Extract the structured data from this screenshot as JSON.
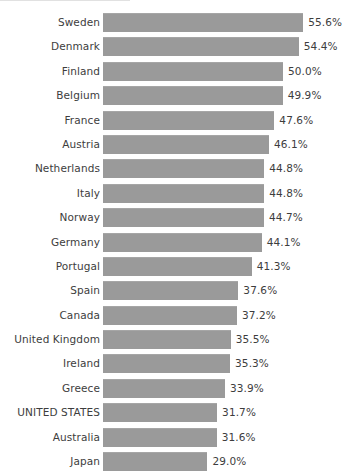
{
  "chart_data": {
    "type": "bar",
    "orientation": "horizontal",
    "title": "",
    "subtitle": "",
    "xlabel": "",
    "ylabel": "",
    "grid": false,
    "legend": null,
    "axis_visible": false,
    "tick_labels": [],
    "value_label_suffix": "%",
    "xlim": [
      0,
      55.6
    ],
    "highlight_category": "UNITED STATES",
    "bar_color": "#9a9a9a",
    "text_color": "#3d3d3d",
    "background_color": "#ffffff",
    "categories": [
      "Sweden",
      "Denmark",
      "Finland",
      "Belgium",
      "France",
      "Austria",
      "Netherlands",
      "Italy",
      "Norway",
      "Germany",
      "Portugal",
      "Spain",
      "Canada",
      "United Kingdom",
      "Ireland",
      "Greece",
      "UNITED STATES",
      "Australia",
      "Japan"
    ],
    "values": [
      55.6,
      54.4,
      50.0,
      49.9,
      47.6,
      46.1,
      44.8,
      44.8,
      44.7,
      44.1,
      41.3,
      37.6,
      37.2,
      35.5,
      35.3,
      33.9,
      31.7,
      31.6,
      29.0
    ],
    "value_labels": [
      "55.6%",
      "54.4%",
      "50.0%",
      "49.9%",
      "47.6%",
      "46.1%",
      "44.8%",
      "44.8%",
      "44.7%",
      "44.1%",
      "41.3%",
      "37.6%",
      "37.2%",
      "35.5%",
      "35.3%",
      "33.9%",
      "31.7%",
      "31.6%",
      "29.0%"
    ]
  },
  "layout": {
    "bar_origin_x": 103,
    "px_per_percent": 3.6,
    "label_gap_px": 5
  }
}
